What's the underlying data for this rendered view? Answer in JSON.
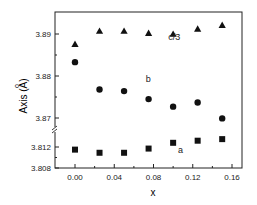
{
  "chart_data": {
    "type": "scatter",
    "title": "",
    "xlabel": "x",
    "ylabel": "Axis (Å)",
    "ylabel_parts": {
      "text": "Axis (",
      "angstrom": "A",
      "ring": "o",
      "close": ")"
    },
    "xlim": [
      -0.015,
      0.17
    ],
    "x_ticks": [
      "0.00",
      "0.04",
      "0.08",
      "0.12",
      "0.16"
    ],
    "x_tick_values": [
      0.0,
      0.04,
      0.08,
      0.12,
      0.16
    ],
    "y_axis_broken": true,
    "y_upper_segment": {
      "range": [
        3.8685,
        3.895
      ],
      "ticks": [
        "3.87",
        "3.88",
        "3.89"
      ],
      "tick_values": [
        3.87,
        3.88,
        3.89
      ]
    },
    "y_lower_segment": {
      "range": [
        3.808,
        3.8135
      ],
      "ticks": [
        "3.808",
        "3.812"
      ],
      "tick_values": [
        3.808,
        3.812
      ]
    },
    "grid": false,
    "legend": null,
    "x": [
      0.0,
      0.025,
      0.05,
      0.075,
      0.1,
      0.125,
      0.15
    ],
    "series": [
      {
        "name": "c/3",
        "marker": "triangle",
        "label": "c/3",
        "values": [
          3.8876,
          3.8907,
          3.8907,
          3.8902,
          3.89,
          3.8912,
          3.8921
        ]
      },
      {
        "name": "b",
        "marker": "circle",
        "label": "b",
        "values": [
          3.8833,
          3.8768,
          3.8764,
          3.8745,
          3.8727,
          3.8737,
          3.8699
        ]
      },
      {
        "name": "a",
        "marker": "square",
        "label": "a",
        "values": [
          3.8115,
          3.8109,
          3.8109,
          3.8117,
          3.8128,
          3.8132,
          3.8135
        ]
      }
    ],
    "annotations": [
      {
        "text": "c/3",
        "x": 0.095,
        "y": 3.8885
      },
      {
        "text": "b",
        "x": 0.072,
        "y": 3.8785
      },
      {
        "text": "a",
        "x": 0.105,
        "y": 3.8108
      }
    ]
  }
}
